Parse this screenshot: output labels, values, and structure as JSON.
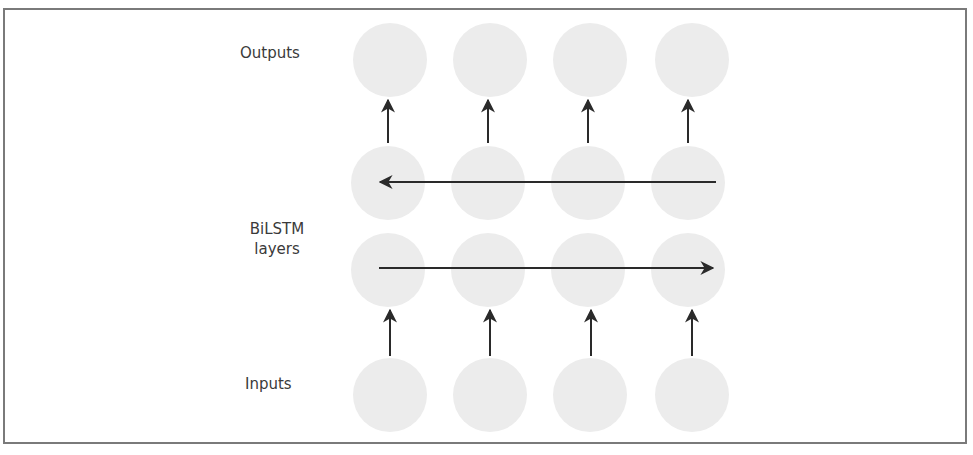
{
  "diagram": {
    "title": "",
    "labels": {
      "outputs": "Outputs",
      "bilstm_line1": "BiLSTM",
      "bilstm_line2": "layers",
      "inputs": "Inputs"
    },
    "columns": 4,
    "rows": [
      "outputs",
      "backward-lstm",
      "forward-lstm",
      "inputs"
    ],
    "node_color": "#ececec",
    "arrow_color": "#2a2a2a",
    "border_color": "#7a7a7a",
    "edges": [
      {
        "from": "inputs",
        "to": "forward-lstm",
        "direction": "up",
        "count": 4
      },
      {
        "from": "forward-lstm",
        "direction": "left-to-right",
        "span": "all columns"
      },
      {
        "from": "backward-lstm",
        "direction": "right-to-left",
        "span": "all columns"
      },
      {
        "from": "backward-lstm",
        "to": "outputs",
        "direction": "up",
        "count": 4
      }
    ]
  }
}
